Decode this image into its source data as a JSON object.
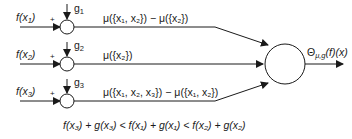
{
  "inputs": [
    {
      "label": "f(x",
      "sub": "1",
      "close": ")",
      "sign": "+",
      "g": "g",
      "g_sub": "1",
      "mu": "μ({x₁, x₂}) − μ({x₂})"
    },
    {
      "label": "f(x",
      "sub": "2",
      "close": ")",
      "sign": "+",
      "g": "g",
      "g_sub": "2",
      "mu": "μ({x₂})"
    },
    {
      "label": "f(x",
      "sub": "3",
      "close": ")",
      "sign": "+",
      "g": "g",
      "g_sub": "3",
      "mu": "μ({x₁, x₂, x₃}) − μ({x₁, x₂})"
    }
  ],
  "output": {
    "symbol": "Θ",
    "sub": "μ,g",
    "rest": "(f)(x)"
  },
  "inequality": "f(x₃) + g(x₃) < f(x₁) + g(x₁) < f(x₂) + g(x₂)",
  "colors": {
    "line": "#1a1a1a",
    "background": "#ffffff"
  }
}
